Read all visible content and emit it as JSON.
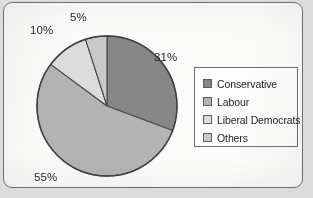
{
  "chart_data": {
    "type": "pie",
    "title": "",
    "categories": [
      "Conservative",
      "Labour",
      "Liberal Democrats",
      "Others"
    ],
    "values": [
      31,
      55,
      10,
      5
    ],
    "value_labels": [
      "31%",
      "55%",
      "10%",
      "5%"
    ],
    "units": "percent",
    "total": 100,
    "start_angle_deg": 0,
    "direction": "clockwise",
    "legend_position": "right",
    "grid": false,
    "colors": [
      "#878787",
      "#b4b4b4",
      "#dcdcdc",
      "#c9c9c9"
    ],
    "slice_border_color": "#4a4a4a",
    "slices": [
      {
        "label": "Conservative",
        "value": 31,
        "display": "31%",
        "color": "#878787"
      },
      {
        "label": "Labour",
        "value": 55,
        "display": "55%",
        "color": "#b4b4b4"
      },
      {
        "label": "Liberal Democrats",
        "value": 10,
        "display": "10%",
        "color": "#dcdcdc"
      },
      {
        "label": "Others",
        "value": 5,
        "display": "5%",
        "color": "#c9c9c9"
      }
    ]
  },
  "labels": {
    "conservative_pct": "31%",
    "labour_pct": "55%",
    "libdem_pct": "10%",
    "others_pct": "5%"
  },
  "legend": {
    "items": [
      {
        "label": "Conservative",
        "color": "#878787"
      },
      {
        "label": "Labour",
        "color": "#b4b4b4"
      },
      {
        "label": "Liberal Democrats",
        "color": "#dcdcdc"
      },
      {
        "label": "Others",
        "color": "#c9c9c9"
      }
    ]
  },
  "theme": {
    "page_background": "#dcdcdc",
    "sheet_background": "#fbfbfa",
    "frame_color": "#6e6e6e",
    "text_color": "#2a2a2a"
  }
}
